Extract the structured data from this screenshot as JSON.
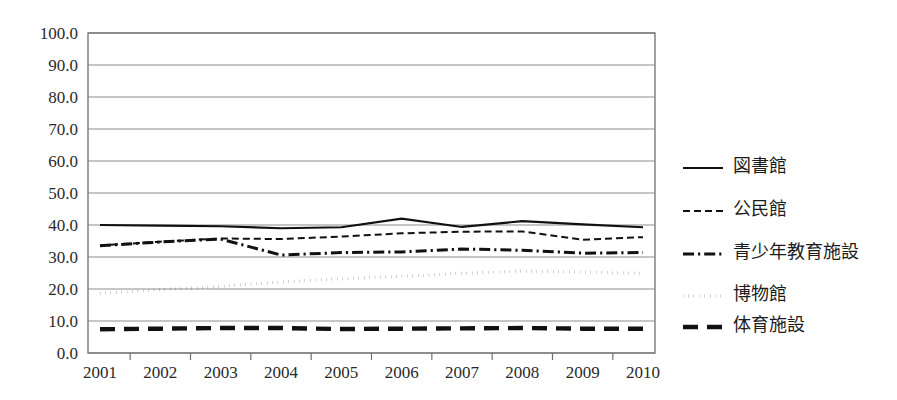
{
  "chart_data": {
    "type": "line",
    "title": "",
    "xlabel": "",
    "ylabel": "",
    "x": [
      2001,
      2002,
      2003,
      2004,
      2005,
      2006,
      2007,
      2008,
      2009,
      2010
    ],
    "categories": [
      "2001",
      "2002",
      "2003",
      "2004",
      "2005",
      "2006",
      "2007",
      "2008",
      "2009",
      "2010"
    ],
    "ylim": [
      0.0,
      100.0
    ],
    "ytick_step": 10.0,
    "ytick_labels": [
      "100.0",
      "90.0",
      "80.0",
      "70.0",
      "60.0",
      "50.0",
      "40.0",
      "30.0",
      "20.0",
      "10.0",
      "0.0"
    ],
    "ytick_values": [
      100.0,
      90.0,
      80.0,
      70.0,
      60.0,
      50.0,
      40.0,
      30.0,
      20.0,
      10.0,
      0.0
    ],
    "grid": true,
    "grid_axis": "y",
    "legend_position": "right",
    "series": [
      {
        "name": "図書館",
        "line_style": "solid",
        "color": "#111111",
        "width": 2.1,
        "values": [
          40.0,
          39.8,
          39.6,
          39.0,
          39.3,
          42.0,
          39.4,
          41.2,
          40.2,
          39.3
        ]
      },
      {
        "name": "公民館",
        "line_style": "dashed",
        "color": "#111111",
        "width": 2.0,
        "values": [
          33.6,
          34.8,
          35.8,
          35.6,
          36.4,
          37.4,
          37.9,
          38.0,
          35.4,
          36.2
        ]
      },
      {
        "name": "青少年教育施設",
        "line_style": "dash-dot",
        "color": "#111111",
        "width": 3.0,
        "values": [
          33.5,
          34.7,
          35.6,
          30.6,
          31.4,
          31.6,
          32.5,
          32.1,
          31.2,
          31.4
        ]
      },
      {
        "name": "博物館",
        "line_style": "dotted",
        "color": "#111111",
        "width": 3.0,
        "values": [
          18.6,
          19.8,
          20.8,
          22.2,
          23.2,
          24.0,
          24.9,
          25.6,
          25.3,
          24.9
        ]
      },
      {
        "name": "体育施設",
        "line_style": "long-dash",
        "color": "#111111",
        "width": 4.4,
        "values": [
          7.4,
          7.6,
          7.8,
          7.8,
          7.5,
          7.6,
          7.7,
          7.8,
          7.6,
          7.6
        ]
      }
    ]
  },
  "legend": {
    "items": [
      {
        "label": "図書館"
      },
      {
        "label": "公民館"
      },
      {
        "label": "青少年教育施設"
      },
      {
        "label": "博物館"
      },
      {
        "label": "体育施設"
      }
    ]
  },
  "axes": {
    "y_labels": [
      "100.0",
      "90.0",
      "80.0",
      "70.0",
      "60.0",
      "50.0",
      "40.0",
      "30.0",
      "20.0",
      "10.0",
      "0.0"
    ],
    "x_labels": [
      "2001",
      "2002",
      "2003",
      "2004",
      "2005",
      "2006",
      "2007",
      "2008",
      "2009",
      "2010"
    ]
  },
  "colors": {
    "background": "#ffffff",
    "ink": "#111111",
    "grid": "#8d8d8d",
    "frame": "#6f6f6f",
    "text": "#2a2a2a"
  }
}
